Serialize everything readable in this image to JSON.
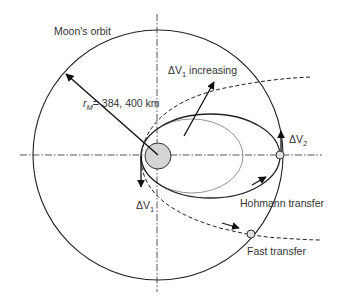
{
  "diagram": {
    "labels": {
      "moons_orbit": "Moon's orbit",
      "radius_symbol": "r",
      "radius_subscript": "M",
      "radius_value": "= 384, 400 km",
      "dv1_increasing_prefix": "ΔV",
      "dv1_increasing_sub": "1",
      "dv1_increasing_suffix": " increasing",
      "dv1_prefix": "ΔV",
      "dv1_sub": "1",
      "dv2_prefix": "ΔV",
      "dv2_sub": "2",
      "hohmann": "Hohmann transfer",
      "fast": "Fast transfer"
    },
    "colors": {
      "line": "#222222",
      "grey_line": "#888888",
      "earth_fill": "#d4d4d4",
      "moon_fill": "#e0e0e0",
      "text": "#333333"
    }
  }
}
